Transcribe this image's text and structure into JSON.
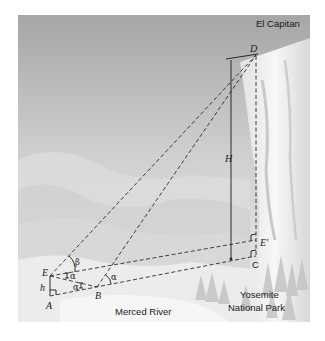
{
  "diagram": {
    "title_label": "El Capitan",
    "region_labels": {
      "river": "Merced River",
      "park_line1": "Yosemite",
      "park_line2": "National Park"
    },
    "points": {
      "D": "D",
      "E": "E",
      "A": "A",
      "B": "B",
      "C": "C",
      "E_prime": "E'"
    },
    "measures": {
      "H": "H",
      "h": "h"
    },
    "angles": {
      "beta": "β",
      "alpha_1": "α",
      "alpha_2": "α",
      "alpha_3": "α"
    },
    "colors": {
      "sky_top": "#a9a9a9",
      "sky_bottom": "#e6e6e6",
      "cliff": "#f2f2f2",
      "line": "#2a2a2a"
    }
  }
}
